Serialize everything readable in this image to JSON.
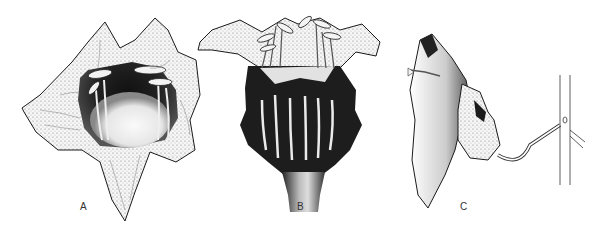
{
  "figure": {
    "panels": [
      {
        "id": "A",
        "label": "A",
        "view": "front view of open flower showing corolla lobes and stamens",
        "label_pos": [
          80,
          202
        ]
      },
      {
        "id": "B",
        "label": "B",
        "view": "side/cutaway view of bell-shaped corolla with exserted stamens and dark veined base",
        "label_pos": [
          297,
          202
        ]
      },
      {
        "id": "C",
        "label": "C",
        "view": "lateral view of flower attached by pedicel to stem",
        "label_pos": [
          460,
          202
        ]
      }
    ]
  },
  "colors": {
    "background": "#ffffff",
    "ink": "#1a1a1a",
    "shade": "#2b2b2b",
    "light": "#f4f4f4"
  }
}
